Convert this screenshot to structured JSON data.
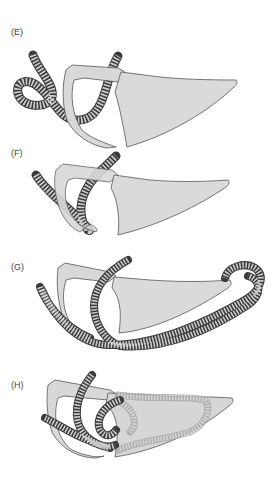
{
  "figure": {
    "panels": [
      {
        "id": "E",
        "label": "(E)"
      },
      {
        "id": "F",
        "label": "(F)"
      },
      {
        "id": "G",
        "label": "(G)"
      },
      {
        "id": "H",
        "label": "(H)"
      }
    ]
  },
  "colors": {
    "bone_fill": "#d9d9d9",
    "bone_stroke": "#555555",
    "tube_fill": "#8a8a8a",
    "tube_dark": "#444444",
    "tube_light": "#d0d0d0",
    "background": "#ffffff"
  }
}
